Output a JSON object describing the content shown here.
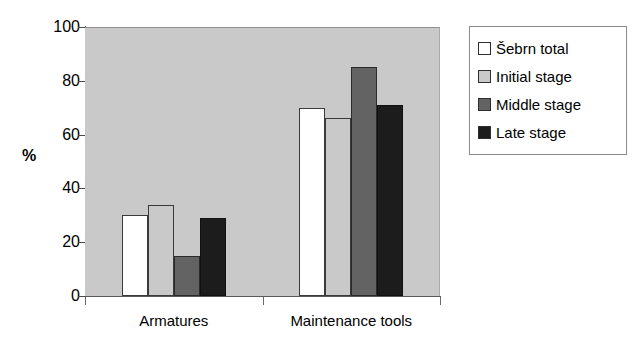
{
  "chart_data": {
    "type": "bar",
    "title": "",
    "subtitle": "",
    "xlabel": "",
    "ylabel": "%",
    "ylim": [
      0,
      100
    ],
    "yticks": [
      0,
      20,
      40,
      60,
      80,
      100
    ],
    "grid": false,
    "legend_position": "right",
    "categories": [
      "Armatures",
      "Maintenance tools"
    ],
    "series": [
      {
        "name": "Šebrn total",
        "color": "#ffffff",
        "values": [
          30,
          70
        ]
      },
      {
        "name": "Initial stage",
        "color": "#c9c9c9",
        "values": [
          34,
          66
        ]
      },
      {
        "name": "Middle stage",
        "color": "#636363",
        "values": [
          15,
          85
        ]
      },
      {
        "name": "Late stage",
        "color": "#1c1c1c",
        "values": [
          29,
          71
        ]
      }
    ]
  },
  "axis": {
    "y_title": "%",
    "tick_labels": [
      "100",
      "80",
      "60",
      "40",
      "20",
      "0"
    ]
  },
  "legend": {
    "entries": [
      {
        "label": "Šebrn total"
      },
      {
        "label": "Initial stage"
      },
      {
        "label": "Middle stage"
      },
      {
        "label": "Late stage"
      }
    ]
  },
  "colors": {
    "plot_background": "#c9c9c9",
    "page_background": "#ffffff",
    "axis": "#5a5a5a",
    "series_1": "#ffffff",
    "series_2": "#c9c9c9",
    "series_3": "#636363",
    "series_4": "#1c1c1c"
  }
}
